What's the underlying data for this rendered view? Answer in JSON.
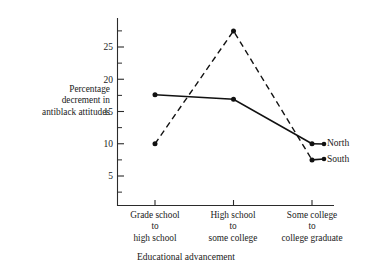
{
  "chart_data": {
    "type": "line",
    "title": "",
    "xlabel": "Educational advancement",
    "ylabel": "Percentage decrement in antiblack attitudes",
    "categories": [
      "Grade school to high school",
      "High school to some college",
      "Some college to college graduate"
    ],
    "category_lines": [
      [
        "Grade school",
        "to",
        "high school"
      ],
      [
        "High school",
        "to",
        "some college"
      ],
      [
        "Some college",
        "to",
        "college graduate"
      ]
    ],
    "yticks": [
      5,
      10,
      15,
      20,
      25
    ],
    "ytick_labels": [
      "5",
      "10",
      "15",
      "20",
      "25"
    ],
    "yminor_ticks": [
      2.5,
      7.5,
      12.5,
      17.5,
      22.5,
      27.5
    ],
    "ylim": [
      2.5,
      28.5
    ],
    "grid": false,
    "legend_position": "right-inline",
    "series": [
      {
        "name": "North",
        "style": "solid",
        "values": [
          17.6,
          16.9,
          10.0
        ]
      },
      {
        "name": "South",
        "style": "dashed",
        "values": [
          10.0,
          27.5,
          7.5
        ]
      }
    ]
  },
  "axis": {
    "ylabel_lines": [
      "Percentage",
      "decrement in",
      "antiblack attitudes"
    ],
    "xlabel": "Educational advancement"
  },
  "labels": {
    "north": "North",
    "south": "South"
  }
}
